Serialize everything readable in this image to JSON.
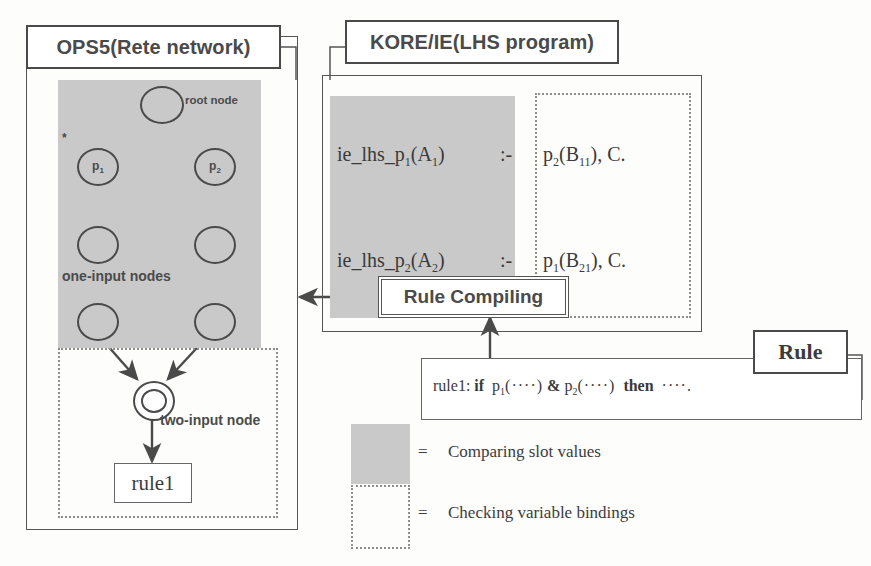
{
  "figure": {
    "title_ops5": "OPS5(Rete network)",
    "title_kore": "KORE/IE(LHS program)",
    "title_rule": "Rule"
  },
  "rete": {
    "root_label": "root node",
    "asterisk": "*",
    "node_p1": "p",
    "node_p1_sub": "1",
    "node_p2": "p",
    "node_p2_sub": "2",
    "one_input_label": "one-input nodes",
    "two_input_label": "two-input node",
    "rule_box_label": "rule1"
  },
  "lhs_program": {
    "lines": [
      {
        "head": "ie_lhs_p",
        "head_sub": "1",
        "head_arg": "(A",
        "head_arg_sub": "1",
        "head_close": ")",
        "neck": ":-",
        "body": "p",
        "body_sub": "2",
        "body_arg": "(B",
        "body_arg_sub": "11",
        "body_close": "), C."
      },
      {
        "head": "ie_lhs_p",
        "head_sub": "2",
        "head_arg": "(A",
        "head_arg_sub": "2",
        "head_close": ")",
        "neck": ":-",
        "body": "p",
        "body_sub": "1",
        "body_arg": "(B",
        "body_arg_sub": "21",
        "body_close": "), C."
      }
    ]
  },
  "process": {
    "rule_compiling_label": "Rule Compiling"
  },
  "rule_source": {
    "prefix": "rule1: ",
    "if_kw": "if",
    "pred1": "p",
    "pred1_sub": "1",
    "pred1_args": "(····)",
    "amp": "&",
    "pred2": "p",
    "pred2_sub": "2",
    "pred2_args": "(····)",
    "then_kw": "then",
    "tail": "····."
  },
  "legend": {
    "items": [
      {
        "swatch": "gray-fill-swatch",
        "separator": "=",
        "label": "Comparing slot values"
      },
      {
        "swatch": "dotted-border-swatch",
        "separator": "=",
        "label": "Checking variable bindings"
      }
    ]
  },
  "colors": {
    "gray_fill": "#c9c9c9",
    "line": "#555555",
    "text": "#3a3a3a",
    "dotted": "#8d8d8d"
  }
}
